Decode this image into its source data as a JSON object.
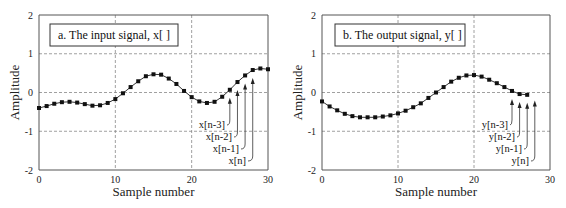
{
  "chart_data": [
    {
      "type": "scatter",
      "id": "left",
      "title": "a.  The input signal, x[  ]",
      "xlabel": "Sample number",
      "ylabel": "Amplitude",
      "xlim": [
        0,
        30
      ],
      "ylim": [
        -2,
        2
      ],
      "xticks": [
        "0",
        "10",
        "20",
        "30"
      ],
      "yticks": [
        "2",
        "1",
        "0",
        "-1",
        "-2"
      ],
      "grid": true,
      "x": [
        0,
        1,
        2,
        3,
        4,
        5,
        6,
        7,
        8,
        9,
        10,
        11,
        12,
        13,
        14,
        15,
        16,
        17,
        18,
        19,
        20,
        21,
        22,
        23,
        24,
        25,
        26,
        27,
        28,
        29,
        30
      ],
      "values": [
        -0.4,
        -0.35,
        -0.29,
        -0.25,
        -0.24,
        -0.26,
        -0.3,
        -0.34,
        -0.33,
        -0.27,
        -0.17,
        -0.02,
        0.14,
        0.29,
        0.42,
        0.47,
        0.46,
        0.36,
        0.22,
        0.04,
        -0.12,
        -0.23,
        -0.27,
        -0.24,
        -0.11,
        0.07,
        0.27,
        0.44,
        0.58,
        0.62,
        0.6
      ],
      "annotations": [
        {
          "text": "x[n-3]",
          "x": 25
        },
        {
          "text": "x[n-2]",
          "x": 26
        },
        {
          "text": "x[n-1]",
          "x": 27
        },
        {
          "text": "x[n]",
          "x": 28
        }
      ]
    },
    {
      "type": "scatter",
      "id": "right",
      "title": "b.  The output signal, y[  ]",
      "xlabel": "Sample number",
      "ylabel": "Amplitude",
      "xlim": [
        0,
        30
      ],
      "ylim": [
        -2,
        2
      ],
      "xticks": [
        "0",
        "10",
        "20",
        "30"
      ],
      "yticks": [
        "2",
        "1",
        "0",
        "-1",
        "-2"
      ],
      "grid": true,
      "x": [
        0,
        1,
        2,
        3,
        4,
        5,
        6,
        7,
        8,
        9,
        10,
        11,
        12,
        13,
        14,
        15,
        16,
        17,
        18,
        19,
        20,
        21,
        22,
        23,
        24,
        25,
        26,
        27
      ],
      "values": [
        -0.23,
        -0.36,
        -0.46,
        -0.55,
        -0.61,
        -0.64,
        -0.64,
        -0.64,
        -0.62,
        -0.59,
        -0.54,
        -0.47,
        -0.38,
        -0.28,
        -0.14,
        0.0,
        0.14,
        0.28,
        0.38,
        0.44,
        0.45,
        0.41,
        0.33,
        0.24,
        0.14,
        0.04,
        -0.04,
        -0.06
      ],
      "annotations": [
        {
          "text": "y[n-3]",
          "x": 25
        },
        {
          "text": "y[n-2]",
          "x": 26
        },
        {
          "text": "y[n-1]",
          "x": 27
        },
        {
          "text": "y[n]",
          "x": 28
        }
      ]
    }
  ]
}
